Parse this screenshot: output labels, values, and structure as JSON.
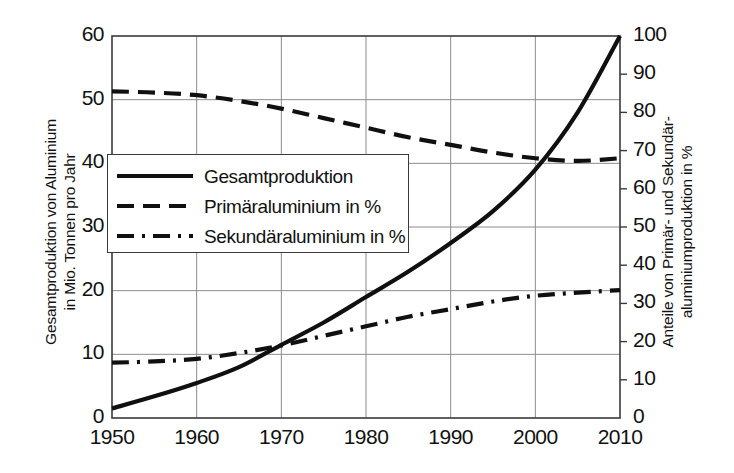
{
  "chart_data": {
    "type": "line",
    "title": "",
    "xlabel": "",
    "ylabel": "Gesamtproduktion von Aluminium in Mio. Tonnen pro Jahr",
    "ylabel_right": "Anteile von Primär- und Sekundäraluminiumproduktion in %",
    "xlim": [
      1950,
      2010
    ],
    "ylim": [
      0,
      60
    ],
    "ylim_right": [
      0,
      100
    ],
    "xticks": [
      1950,
      1960,
      1970,
      1980,
      1990,
      2000,
      2010
    ],
    "yticks_left": [
      0,
      10,
      20,
      30,
      40,
      50,
      60
    ],
    "yticks_right": [
      0,
      10,
      20,
      30,
      40,
      50,
      60,
      70,
      80,
      90,
      100
    ],
    "grid": true,
    "legend_position": "center-left",
    "x": [
      1950,
      1955,
      1960,
      1965,
      1970,
      1975,
      1980,
      1985,
      1990,
      1995,
      2000,
      2005,
      2010
    ],
    "series": [
      {
        "name": "Gesamtproduktion",
        "axis": "left",
        "unit": "Mio. t/Jahr",
        "style": "solid",
        "values": [
          1.5,
          3.4,
          5.5,
          8.0,
          11.5,
          15.0,
          19.0,
          23.0,
          27.5,
          32.5,
          39.0,
          48.0,
          60.0
        ]
      },
      {
        "name": "Primäraluminium in %",
        "axis": "right",
        "unit": "%",
        "style": "dashed",
        "values": [
          85.5,
          85.2,
          84.5,
          83.0,
          81.0,
          78.5,
          76.0,
          73.5,
          71.5,
          69.5,
          68.0,
          67.3,
          68.0
        ]
      },
      {
        "name": "Sekundäraluminium in %",
        "axis": "right",
        "unit": "%",
        "style": "dash-dot",
        "values": [
          14.5,
          14.8,
          15.5,
          17.0,
          19.0,
          21.5,
          24.0,
          26.5,
          28.5,
          30.5,
          32.0,
          32.8,
          33.5
        ]
      }
    ]
  },
  "axes": {
    "left_title_lines": [
      "Gesamtproduktion von Aluminium",
      "in Mio. Tonnen pro Jahr"
    ],
    "right_title_lines": [
      "Anteile von Primär- und Sekundär-",
      "aluminiumproduktion in %"
    ],
    "left_ticks": [
      "60",
      "50",
      "40",
      "30",
      "20",
      "10",
      "0"
    ],
    "right_ticks": [
      "100",
      "90",
      "80",
      "70",
      "60",
      "50",
      "40",
      "30",
      "20",
      "10",
      "0"
    ],
    "x_ticks": [
      "1950",
      "1960",
      "1970",
      "1980",
      "1990",
      "2000",
      "2010"
    ]
  },
  "legend": {
    "items": [
      {
        "label": "Gesamtproduktion",
        "style": "solid"
      },
      {
        "label": "Primäraluminium in %",
        "style": "dashed"
      },
      {
        "label": "Sekundäraluminium in %",
        "style": "dash-dot"
      }
    ]
  },
  "colors": {
    "line": "#101010",
    "grid": "#8c8c8c",
    "frame": "#3a3a3a",
    "background": "#ffffff"
  }
}
